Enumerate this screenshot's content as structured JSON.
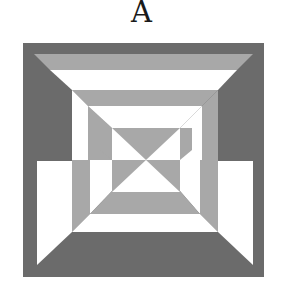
{
  "figure": {
    "label": "A",
    "colors": {
      "dark": "#6b6b6b",
      "light": "#a8a8a8",
      "white": "#ffffff"
    },
    "shapes": [
      {
        "name": "outer-dark-square",
        "fill": "dark",
        "points": "23,43 264,43 264,277 23,277"
      },
      {
        "name": "top-light-band",
        "fill": "light",
        "points": "34,54 253,54 237,70 50,70"
      },
      {
        "name": "top-white-band",
        "fill": "white",
        "points": "50,70 237,70 218,90 72,90"
      },
      {
        "name": "top-inner-light-trapezoid",
        "fill": "light",
        "points": "72,90 218,90 202,106 88,106"
      },
      {
        "name": "left-white-strip-upper",
        "fill": "white",
        "points": "72,90 88,106 88,160 72,160"
      },
      {
        "name": "left-light-strip-upper",
        "fill": "light",
        "points": "88,106 112,128 112,160 88,160"
      },
      {
        "name": "left-gap-white-upper",
        "fill": "white",
        "points": "88,106 202,106 180,128 112,128"
      },
      {
        "name": "right-light-strip-upper",
        "fill": "light",
        "points": "202,106 218,90 218,160 202,160"
      },
      {
        "name": "right-white-strip-upper",
        "fill": "white",
        "points": "180,128 202,106 202,160 180,160"
      },
      {
        "name": "left-white-panel",
        "fill": "white",
        "points": "37,161 72,161 72,232 37,265"
      },
      {
        "name": "left-light-strip-lower",
        "fill": "light",
        "points": "72,160 90,160 90,214 72,232"
      },
      {
        "name": "left-white-strip-lower",
        "fill": "white",
        "points": "90,160 112,160 112,191 90,214"
      },
      {
        "name": "right-white-panel",
        "fill": "white",
        "points": "218,161 253,161 253,265 218,232"
      },
      {
        "name": "right-light-strip-lower",
        "fill": "light",
        "points": "200,160 218,160 218,232 200,214"
      },
      {
        "name": "right-white-strip-lower",
        "fill": "white",
        "points": "180,160 200,160 200,214 180,191"
      },
      {
        "name": "bottom-light-trapezoid",
        "fill": "light",
        "points": "112,191 180,191 200,214 90,214"
      },
      {
        "name": "bottom-white-band",
        "fill": "white",
        "points": "90,214 200,214 218,232 72,232"
      },
      {
        "name": "center-white-square",
        "fill": "white",
        "points": "112,128 180,128 180,192 112,192"
      },
      {
        "name": "center-top-triangle",
        "fill": "light",
        "points": "112,128 180,128 146,160"
      },
      {
        "name": "center-left-block",
        "fill": "light",
        "points": "112,160 146,160 112,192"
      },
      {
        "name": "center-right-block",
        "fill": "light",
        "points": "146,160 180,160 180,192"
      },
      {
        "name": "center-left-side",
        "fill": "light",
        "points": "100,128 112,128 112,160 100,150"
      },
      {
        "name": "center-right-side",
        "fill": "light",
        "points": "180,128 192,128 192,150 180,160"
      }
    ]
  }
}
